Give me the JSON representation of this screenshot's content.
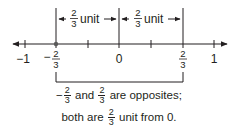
{
  "diagram": {
    "type": "number-line",
    "colors": {
      "ink": "#231f20",
      "dot": "#5a5a5a"
    },
    "axis": {
      "ticks": [
        {
          "value": -1,
          "label": "−1"
        },
        {
          "value": -0.6667,
          "label_sign": "−",
          "label_num": "2",
          "label_den": "3",
          "marked_point": true
        },
        {
          "value": -0.3333,
          "label": ""
        },
        {
          "value": 0,
          "label": "0"
        },
        {
          "value": 0.3333,
          "label": ""
        },
        {
          "value": 0.6667,
          "label_num": "2",
          "label_den": "3"
        },
        {
          "value": 1,
          "label": "1"
        }
      ]
    },
    "distance_labels": [
      {
        "num": "2",
        "den": "3",
        "unit": "unit"
      },
      {
        "num": "2",
        "den": "3",
        "unit": "unit"
      }
    ],
    "caption": {
      "line1": {
        "neg_sign": "−",
        "a_num": "2",
        "a_den": "3",
        "mid": "and",
        "b_num": "2",
        "b_den": "3",
        "end": "are opposites;"
      },
      "line2": {
        "start": "both are",
        "num": "2",
        "den": "3",
        "end": "unit from 0."
      }
    }
  }
}
